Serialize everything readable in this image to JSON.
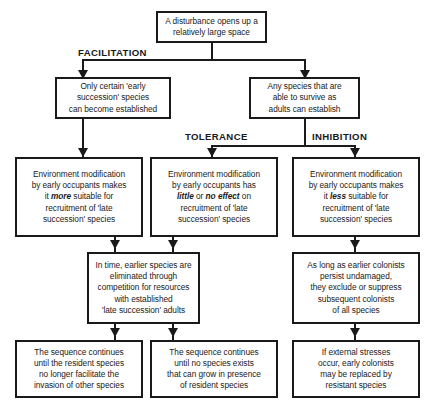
{
  "diagram": {
    "type": "flowchart",
    "phase_labels": [
      {
        "id": "facilitation",
        "text": "FACILITATION"
      },
      {
        "id": "tolerance",
        "text": "TOLERANCE"
      },
      {
        "id": "inhibition",
        "text": "INHIBITION"
      }
    ],
    "nodes": [
      {
        "id": "disturbance",
        "text": "A disturbance opens up a\nrelatively large space"
      },
      {
        "id": "early-succession",
        "text": "Only certain 'early\nsuccession' species\ncan become established"
      },
      {
        "id": "any-species",
        "text": "Any species that are\nable to survive as\nadults can establish"
      },
      {
        "id": "env-mod-more",
        "text_parts": [
          {
            "t": "Environment modification\nby early occupants makes\nit ",
            "em": false
          },
          {
            "t": "more",
            "em": true
          },
          {
            "t": " suitable for\nrecruitment of 'late\nsuccession'  species",
            "em": false
          }
        ]
      },
      {
        "id": "env-mod-little",
        "text_parts": [
          {
            "t": "Environment modification\nby early occupants has\n",
            "em": false
          },
          {
            "t": "little",
            "em": true
          },
          {
            "t": " or ",
            "em": false
          },
          {
            "t": "no effect",
            "em": true
          },
          {
            "t": " on\nrecruitment of 'late\nsuccession'  species",
            "em": false
          }
        ]
      },
      {
        "id": "env-mod-less",
        "text_parts": [
          {
            "t": "Environment modification\nby early occupants makes\nit ",
            "em": false
          },
          {
            "t": "less",
            "em": true
          },
          {
            "t": " suitable for\nrecruitment of 'late\nsuccession'  species",
            "em": false
          }
        ]
      },
      {
        "id": "in-time-eliminated",
        "text": "In time, earlier species are\neliminated through\ncompetition for resources\nwith established\n'late succession' adults"
      },
      {
        "id": "as-long-as",
        "text": "As long as earlier colonists\npersist undamaged,\nthey exclude or suppress\nsubsequent colonists\nof all species"
      },
      {
        "id": "sequence-facilitate",
        "text": "The sequence continues\nuntil the resident species\nno longer facilitate the\ninvasion of other species"
      },
      {
        "id": "sequence-no-species",
        "text": "The sequence continues\nuntil no  species exists\nthat can grow in presence\nof resident species"
      },
      {
        "id": "external-stresses",
        "text": "If external stresses\noccur, early colonists\nmay be replaced by\nresistant species"
      }
    ],
    "colors": {
      "stroke": "#1a1a1a",
      "fill": "#ffffff",
      "text": "#1a1a1a"
    }
  }
}
